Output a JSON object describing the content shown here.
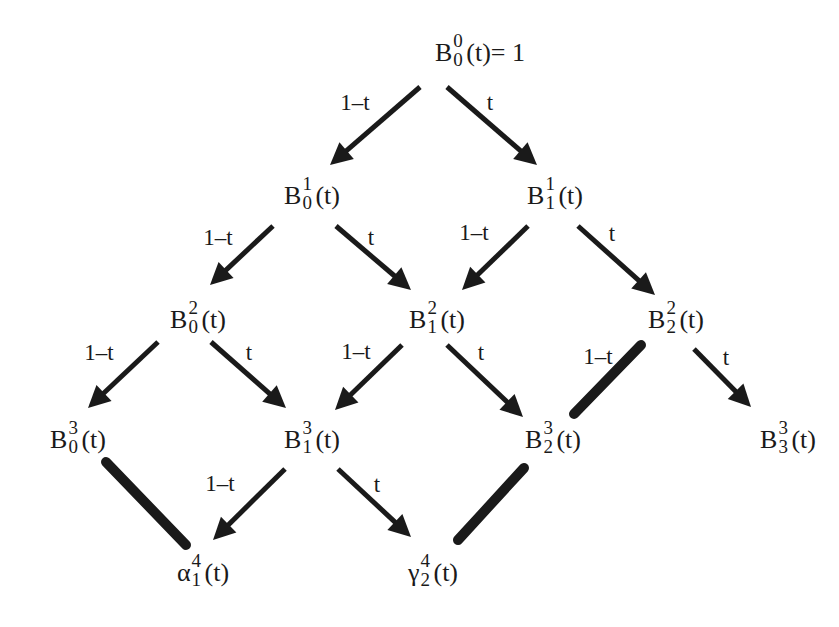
{
  "diagram": {
    "nodes": [
      {
        "id": "B00",
        "base": "B",
        "sup": "0",
        "sub": "0",
        "arg": "(t)",
        "suffix": "= 1",
        "x": 480,
        "y": 55
      },
      {
        "id": "B01",
        "base": "B",
        "sup": "1",
        "sub": "0",
        "arg": "(t)",
        "suffix": "",
        "x": 312,
        "y": 198
      },
      {
        "id": "B11",
        "base": "B",
        "sup": "1",
        "sub": "1",
        "arg": "(t)",
        "suffix": "",
        "x": 555,
        "y": 198
      },
      {
        "id": "B02",
        "base": "B",
        "sup": "2",
        "sub": "0",
        "arg": "(t)",
        "suffix": "",
        "x": 198,
        "y": 322
      },
      {
        "id": "B12",
        "base": "B",
        "sup": "2",
        "sub": "1",
        "arg": "(t)",
        "suffix": "",
        "x": 437,
        "y": 322
      },
      {
        "id": "B22",
        "base": "B",
        "sup": "2",
        "sub": "2",
        "arg": "(t)",
        "suffix": "",
        "x": 676,
        "y": 322
      },
      {
        "id": "B03",
        "base": "B",
        "sup": "3",
        "sub": "0",
        "arg": "(t)",
        "suffix": "",
        "x": 78,
        "y": 442
      },
      {
        "id": "B13",
        "base": "B",
        "sup": "3",
        "sub": "1",
        "arg": "(t)",
        "suffix": "",
        "x": 312,
        "y": 442
      },
      {
        "id": "B23",
        "base": "B",
        "sup": "3",
        "sub": "2",
        "arg": "(t)",
        "suffix": "",
        "x": 553,
        "y": 442
      },
      {
        "id": "B33",
        "base": "B",
        "sup": "3",
        "sub": "3",
        "arg": "(t)",
        "suffix": "",
        "x": 788,
        "y": 442
      },
      {
        "id": "alpha",
        "base": "α",
        "sup": "4",
        "sub": "1",
        "arg": "(t)",
        "suffix": "",
        "x": 203,
        "y": 575
      },
      {
        "id": "gamma",
        "base": "γ",
        "sup": "4",
        "sub": "2",
        "arg": "(t)",
        "suffix": "",
        "x": 433,
        "y": 575
      }
    ],
    "edges": [
      {
        "from": "B00",
        "to": "B01",
        "label": "1–t",
        "type": "arrow",
        "x1": 420,
        "y1": 87,
        "x2": 330,
        "y2": 165,
        "lx": 355,
        "ly": 102
      },
      {
        "from": "B00",
        "to": "B11",
        "label": "t",
        "type": "arrow",
        "x1": 447,
        "y1": 87,
        "x2": 537,
        "y2": 165,
        "lx": 490,
        "ly": 102
      },
      {
        "from": "B01",
        "to": "B02",
        "label": "1–t",
        "type": "arrow",
        "x1": 273,
        "y1": 226,
        "x2": 210,
        "y2": 285,
        "lx": 218,
        "ly": 237
      },
      {
        "from": "B01",
        "to": "B12",
        "label": "t",
        "type": "arrow",
        "x1": 336,
        "y1": 226,
        "x2": 411,
        "y2": 290,
        "lx": 371,
        "ly": 237
      },
      {
        "from": "B11",
        "to": "B12",
        "label": "1–t",
        "type": "arrow",
        "x1": 528,
        "y1": 226,
        "x2": 462,
        "y2": 290,
        "lx": 474,
        "ly": 232
      },
      {
        "from": "B11",
        "to": "B22",
        "label": "t",
        "type": "arrow",
        "x1": 578,
        "y1": 226,
        "x2": 655,
        "y2": 295,
        "lx": 612,
        "ly": 233
      },
      {
        "from": "B02",
        "to": "B03",
        "label": "1–t",
        "type": "arrow",
        "x1": 158,
        "y1": 342,
        "x2": 88,
        "y2": 408,
        "lx": 99,
        "ly": 352
      },
      {
        "from": "B02",
        "to": "B13",
        "label": "t",
        "type": "arrow",
        "x1": 211,
        "y1": 342,
        "x2": 286,
        "y2": 408,
        "lx": 249,
        "ly": 352
      },
      {
        "from": "B12",
        "to": "B13",
        "label": "1–t",
        "type": "arrow",
        "x1": 402,
        "y1": 345,
        "x2": 335,
        "y2": 410,
        "lx": 356,
        "ly": 351
      },
      {
        "from": "B12",
        "to": "B23",
        "label": "t",
        "type": "arrow",
        "x1": 447,
        "y1": 345,
        "x2": 523,
        "y2": 417,
        "lx": 481,
        "ly": 352
      },
      {
        "from": "B22",
        "to": "B23",
        "label": "1–t",
        "type": "thick",
        "x1": 641,
        "y1": 345,
        "x2": 574,
        "y2": 414,
        "lx": 598,
        "ly": 356
      },
      {
        "from": "B22",
        "to": "B33",
        "label": "t",
        "type": "arrow",
        "x1": 694,
        "y1": 349,
        "x2": 751,
        "y2": 407,
        "lx": 726,
        "ly": 357
      },
      {
        "from": "B03",
        "to": "alpha",
        "label": "",
        "type": "thick",
        "x1": 106,
        "y1": 462,
        "x2": 186,
        "y2": 545,
        "lx": 0,
        "ly": 0
      },
      {
        "from": "B13",
        "to": "alpha",
        "label": "1–t",
        "type": "arrow",
        "x1": 285,
        "y1": 469,
        "x2": 213,
        "y2": 540,
        "lx": 220,
        "ly": 483
      },
      {
        "from": "B13",
        "to": "gamma",
        "label": "t",
        "type": "arrow",
        "x1": 338,
        "y1": 469,
        "x2": 411,
        "y2": 537,
        "lx": 377,
        "ly": 484
      },
      {
        "from": "B23",
        "to": "gamma",
        "label": "",
        "type": "thick",
        "x1": 524,
        "y1": 468,
        "x2": 458,
        "y2": 540,
        "lx": 0,
        "ly": 0
      }
    ]
  }
}
